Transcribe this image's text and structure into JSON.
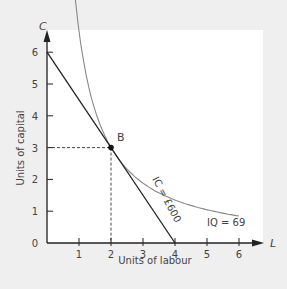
{
  "chart_data": {
    "type": "line",
    "title": "",
    "xlabel": "Units of labour",
    "ylabel": "Units of capital",
    "x_axis_letter": "L",
    "y_axis_letter": "C",
    "xlim": [
      0,
      6.7
    ],
    "ylim": [
      0,
      6.7
    ],
    "x_ticks": [
      "1",
      "2",
      "3",
      "4",
      "5",
      "6"
    ],
    "y_ticks": [
      "0",
      "1",
      "2",
      "3",
      "4",
      "5",
      "6"
    ],
    "grid": false,
    "series": [
      {
        "name": "IC = £600",
        "kind": "isocost",
        "points": [
          [
            0,
            6
          ],
          [
            4,
            0
          ]
        ]
      },
      {
        "name": "IQ = 69",
        "kind": "isoquant",
        "points": [
          [
            0.9,
            6
          ],
          [
            1.2,
            4.8
          ],
          [
            1.5,
            3.8
          ],
          [
            2,
            3
          ],
          [
            3,
            2.1
          ],
          [
            4,
            1.6
          ],
          [
            5,
            1.2
          ],
          [
            6,
            1.0
          ]
        ]
      }
    ],
    "annotations": [
      {
        "text": "B",
        "x": 2,
        "y": 3,
        "marker": "dot",
        "dashed_guides": true
      },
      {
        "text": "IC = £600",
        "rotated": true
      },
      {
        "text": "IQ = 69"
      }
    ]
  }
}
